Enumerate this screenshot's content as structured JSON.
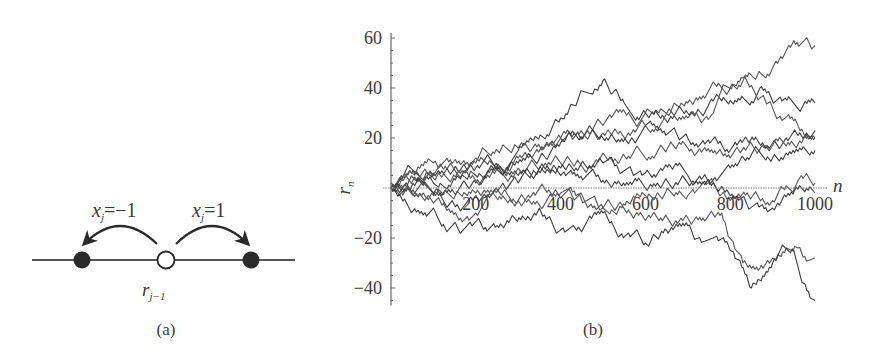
{
  "panel_a": {
    "caption": "(a)",
    "left_jump_label": "x_j = −1",
    "right_jump_label": "x_j = 1",
    "left_var": "x",
    "left_sub": "j",
    "left_rhs": "=−1",
    "right_var": "x",
    "right_sub": "j",
    "right_rhs": "=1",
    "center_var": "r",
    "center_sub": "j−1",
    "colors": {
      "filled": "#2a2a2a",
      "open": "#ffffff",
      "line": "#555555"
    }
  },
  "panel_b": {
    "caption": "(b)"
  },
  "chart_data": {
    "type": "line",
    "title": "",
    "xlabel": "n",
    "ylabel": "r_n",
    "xlim": [
      0,
      1000
    ],
    "ylim": [
      -47,
      62
    ],
    "xticks": [
      200,
      400,
      600,
      800,
      1000
    ],
    "xtick_labels": [
      "200",
      "400",
      "600",
      "800",
      "1000"
    ],
    "yticks": [
      -40,
      -20,
      20,
      40,
      60
    ],
    "ytick_labels": [
      "−40",
      "−20",
      "20",
      "40",
      "60"
    ],
    "grid": false,
    "legend": null,
    "series": [
      {
        "name": "walk 1",
        "points": [
          [
            0,
            0
          ],
          [
            100,
            4
          ],
          [
            200,
            10
          ],
          [
            300,
            12
          ],
          [
            400,
            20
          ],
          [
            500,
            25
          ],
          [
            600,
            30
          ],
          [
            700,
            34
          ],
          [
            800,
            40
          ],
          [
            900,
            48
          ],
          [
            950,
            59
          ],
          [
            1000,
            57
          ]
        ]
      },
      {
        "name": "walk 2",
        "points": [
          [
            0,
            0
          ],
          [
            100,
            6
          ],
          [
            200,
            8
          ],
          [
            300,
            15
          ],
          [
            400,
            28
          ],
          [
            500,
            43
          ],
          [
            550,
            34
          ],
          [
            600,
            30
          ],
          [
            700,
            30
          ],
          [
            800,
            35
          ],
          [
            870,
            40
          ],
          [
            930,
            36
          ],
          [
            1000,
            34
          ]
        ]
      },
      {
        "name": "walk 3",
        "points": [
          [
            0,
            2
          ],
          [
            100,
            10
          ],
          [
            200,
            12
          ],
          [
            300,
            16
          ],
          [
            400,
            20
          ],
          [
            500,
            22
          ],
          [
            600,
            25
          ],
          [
            700,
            28
          ],
          [
            760,
            30
          ],
          [
            830,
            44
          ],
          [
            870,
            36
          ],
          [
            930,
            28
          ],
          [
            1000,
            20
          ]
        ]
      },
      {
        "name": "walk 4",
        "points": [
          [
            0,
            0
          ],
          [
            100,
            2
          ],
          [
            200,
            5
          ],
          [
            300,
            10
          ],
          [
            400,
            18
          ],
          [
            500,
            20
          ],
          [
            600,
            25
          ],
          [
            700,
            20
          ],
          [
            800,
            15
          ],
          [
            900,
            18
          ],
          [
            1000,
            23
          ]
        ]
      },
      {
        "name": "walk 5",
        "points": [
          [
            0,
            0
          ],
          [
            100,
            5
          ],
          [
            200,
            3
          ],
          [
            300,
            8
          ],
          [
            400,
            10
          ],
          [
            500,
            14
          ],
          [
            600,
            12
          ],
          [
            700,
            16
          ],
          [
            800,
            12
          ],
          [
            900,
            17
          ],
          [
            1000,
            20
          ]
        ]
      },
      {
        "name": "walk 6",
        "points": [
          [
            0,
            0
          ],
          [
            100,
            -2
          ],
          [
            200,
            2
          ],
          [
            300,
            5
          ],
          [
            400,
            8
          ],
          [
            500,
            10
          ],
          [
            600,
            6
          ],
          [
            700,
            5
          ],
          [
            800,
            8
          ],
          [
            900,
            12
          ],
          [
            1000,
            15
          ]
        ]
      },
      {
        "name": "walk 7",
        "points": [
          [
            0,
            0
          ],
          [
            100,
            -3
          ],
          [
            200,
            -2
          ],
          [
            300,
            -5
          ],
          [
            400,
            -4
          ],
          [
            500,
            -8
          ],
          [
            600,
            -3
          ],
          [
            700,
            -3
          ],
          [
            800,
            -5
          ],
          [
            900,
            -5
          ],
          [
            960,
            3
          ],
          [
            1000,
            2
          ]
        ]
      },
      {
        "name": "walk 8",
        "points": [
          [
            0,
            0
          ],
          [
            100,
            -2
          ],
          [
            200,
            -3
          ],
          [
            300,
            2
          ],
          [
            400,
            5
          ],
          [
            500,
            3
          ],
          [
            600,
            0
          ],
          [
            700,
            2
          ],
          [
            800,
            -3
          ],
          [
            900,
            -8
          ],
          [
            1000,
            -2
          ]
        ]
      },
      {
        "name": "walk 9",
        "points": [
          [
            0,
            0
          ],
          [
            100,
            -6
          ],
          [
            200,
            -10
          ],
          [
            300,
            -5
          ],
          [
            400,
            -2
          ],
          [
            500,
            -8
          ],
          [
            600,
            -13
          ],
          [
            700,
            -12
          ],
          [
            780,
            -10
          ],
          [
            830,
            -30
          ],
          [
            870,
            -32
          ],
          [
            900,
            -28
          ],
          [
            960,
            -24
          ],
          [
            1000,
            -28
          ]
        ]
      },
      {
        "name": "walk 10",
        "points": [
          [
            0,
            0
          ],
          [
            100,
            -8
          ],
          [
            250,
            -15
          ],
          [
            350,
            -8
          ],
          [
            430,
            -15
          ],
          [
            500,
            -10
          ],
          [
            560,
            -18
          ],
          [
            600,
            -22
          ],
          [
            650,
            -17
          ],
          [
            700,
            -15
          ],
          [
            760,
            -20
          ],
          [
            800,
            -25
          ],
          [
            850,
            -40
          ],
          [
            900,
            -30
          ],
          [
            950,
            -25
          ],
          [
            1000,
            -45
          ]
        ]
      }
    ]
  }
}
